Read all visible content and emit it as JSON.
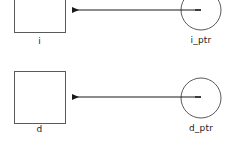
{
  "diagram": {
    "background_color": "#ffffff",
    "shape_stroke_color": "#555555",
    "arrow_color": "#1a1a1a",
    "text_color": "#1a1a1a",
    "groups": [
      {
        "id": "int-group",
        "box": {
          "name": "i",
          "label": "i",
          "shape": "square",
          "x": 14,
          "y": -18,
          "width": 51,
          "height": 51,
          "clipped_top": true
        },
        "pointer": {
          "name": "i_ptr",
          "label": "i_ptr",
          "shape": "circle",
          "cx": 201,
          "cy": 10,
          "r": 20,
          "clipped_top": true
        },
        "arrow": {
          "name": "i_ptr-to-i",
          "from_x": 201,
          "from_y": 10,
          "to_x": 66,
          "to_y": 10,
          "head": "left"
        }
      },
      {
        "id": "double-group",
        "box": {
          "name": "d",
          "label": "d",
          "shape": "square",
          "x": 14,
          "y": 71,
          "width": 51,
          "height": 52,
          "clipped_top": false
        },
        "pointer": {
          "name": "d_ptr",
          "label": "d_ptr",
          "shape": "circle",
          "cx": 201,
          "cy": 98,
          "r": 20,
          "clipped_top": false
        },
        "arrow": {
          "name": "d_ptr-to-d",
          "from_x": 201,
          "from_y": 97,
          "to_x": 66,
          "to_y": 97,
          "head": "left"
        }
      }
    ]
  }
}
